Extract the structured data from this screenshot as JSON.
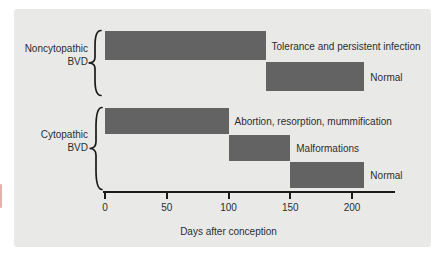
{
  "figure": {
    "background": "#ffffff",
    "panel_color": "#e9e9e7",
    "bar_color": "#636363",
    "text_color": "#2e2e2e",
    "axis_color": "#1a1a1a"
  },
  "chart_data": {
    "type": "bar",
    "subtype": "horizontal-timeline-gantt",
    "title": "",
    "xlabel": "Days after conception",
    "x_ticks": [
      0,
      50,
      100,
      150,
      200
    ],
    "x_range": [
      0,
      235
    ],
    "grid": false,
    "legend": false,
    "groups": [
      {
        "name": "Noncytopathic BVD",
        "name_lines": [
          "Noncytopathic",
          "BVD"
        ],
        "bars": [
          {
            "label": "Tolerance and persistent infection",
            "start_day": 0,
            "end_day": 130
          },
          {
            "label": "Normal",
            "start_day": 130,
            "end_day": 210
          }
        ]
      },
      {
        "name": "Cytopathic BVD",
        "name_lines": [
          "Cytopathic",
          "BVD"
        ],
        "bars": [
          {
            "label": "Abortion, resorption, mummification",
            "start_day": 0,
            "end_day": 100
          },
          {
            "label": "Malformations",
            "start_day": 100,
            "end_day": 150
          },
          {
            "label": "Normal",
            "start_day": 150,
            "end_day": 210
          }
        ]
      }
    ]
  }
}
